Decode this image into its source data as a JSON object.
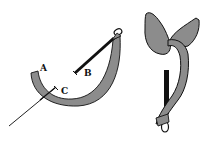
{
  "figure": {
    "colors": {
      "band_fill": "#8c8c8c",
      "outline": "#111111",
      "needle": "#111111",
      "background": "#ffffff"
    },
    "left_diagram": {
      "labels": {
        "a": "A",
        "b": "B",
        "c": "C"
      }
    },
    "right_diagram": {}
  }
}
